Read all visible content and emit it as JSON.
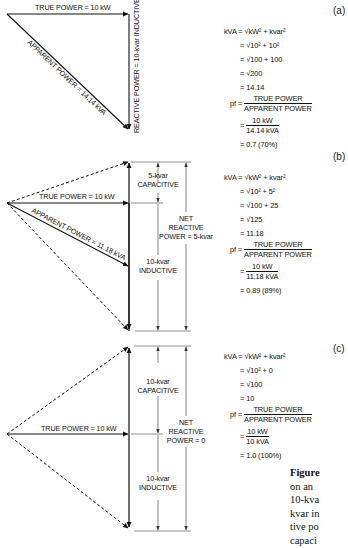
{
  "figure": {
    "panels": [
      {
        "tag": "(a)",
        "labels": {
          "true_power": "TRUE POWER = 10 kW",
          "apparent_power": "APPARENT POWER = 14.14 kVA",
          "reactive_power": "REACTIVE POWER = 10-kvar INDUCTIVE"
        },
        "equations": {
          "l1_lhs": "kVA",
          "l1": "= √kW² + kvar²",
          "l2": "= √10² + 10²",
          "l3": "= √100 + 100",
          "l4": "= √200",
          "l5": "= 14.14",
          "pf_lhs": "pf =",
          "pf_num": "TRUE POWER",
          "pf_den": "APPARENT POWER",
          "val_num": "10 kW",
          "val_den": "14.14 kVA",
          "result": "= 0.7 (70%)"
        }
      },
      {
        "tag": "(b)",
        "labels": {
          "true_power": "TRUE POWER = 10 kW",
          "apparent_power": "APPARENT POWER = 11.18 kVA",
          "capacitive_l1": "5-kvar",
          "capacitive_l2": "CAPACITIVE",
          "inductive_l1": "10-kvar",
          "inductive_l2": "INDUCTIVE",
          "net_l1": "NET",
          "net_l2": "REACTIVE",
          "net_l3": "POWER = 5-kvar"
        },
        "equations": {
          "l1_lhs": "kVA",
          "l1": "= √kW² + kvar²",
          "l2": "= √10² + 5²",
          "l3": "= √100 + 25",
          "l4": "= √125",
          "l5": "= 11.18",
          "pf_lhs": "pf =",
          "pf_num": "TRUE POWER",
          "pf_den": "APPARENT POWER",
          "val_num": "10 kW",
          "val_den": "11.18 kVA",
          "result": "= 0.89 (89%)"
        }
      },
      {
        "tag": "(c)",
        "labels": {
          "true_power": "TRUE POWER = 10 kW",
          "capacitive_l1": "10-kvar",
          "capacitive_l2": "CAPACITIVE",
          "inductive_l1": "10-kvar",
          "inductive_l2": "INDUCTIVE",
          "net_l1": "NET",
          "net_l2": "REACTIVE",
          "net_l3": "POWER = 0"
        },
        "equations": {
          "l1_lhs": "kVA",
          "l1": "= √kW² + kvar²",
          "l2": "= √10² + 0",
          "l3": "= √100",
          "l4": "= 10",
          "pf_lhs": "pf =",
          "pf_num": "TRUE POWER",
          "pf_den": "APPARENT POWER",
          "val_num": "10 kW",
          "val_den": "10 kVA",
          "result": "= 1.0 (100%)"
        }
      }
    ],
    "caption": {
      "lead": "Figure",
      "lines": [
        "on an",
        "10-kva",
        "kvar in",
        "tive po",
        "capaci"
      ]
    }
  }
}
